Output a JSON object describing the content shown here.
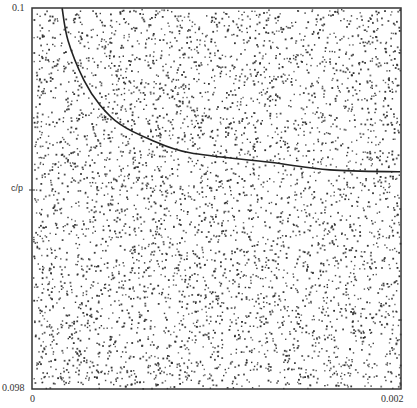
{
  "chart_data": {
    "type": "scatter",
    "title": "",
    "xlabel": "",
    "ylabel": "",
    "xlim": [
      0,
      0.002
    ],
    "ylim": [
      0.098,
      0.1
    ],
    "x_ticks": [
      {
        "value": 0,
        "label": "0"
      },
      {
        "value": 0.002,
        "label": "0.002"
      }
    ],
    "y_ticks": [
      {
        "value": 0.1,
        "label": "0.1"
      },
      {
        "value": 0.09904,
        "label": "c/p"
      },
      {
        "value": 0.098,
        "label": "0.098"
      }
    ],
    "grid": false,
    "legend": null,
    "series": [
      {
        "name": "random points",
        "type": "scatter",
        "distribution": "uniform",
        "approx_count": 4600,
        "color": "#2a2a2a"
      },
      {
        "name": "curve",
        "type": "line",
        "color": "#222222",
        "x": [
          0.000163,
          0.000195,
          0.000282,
          0.000369,
          0.000477,
          0.00064,
          0.000856,
          0.00129,
          0.001615,
          0.001995
        ],
        "y": [
          0.1,
          0.09983,
          0.09962,
          0.09949,
          0.09939,
          0.09931,
          0.09924,
          0.09919,
          0.09915,
          0.09914
        ]
      }
    ]
  },
  "labels": {
    "y_top": "0.1",
    "y_mid": "c/p",
    "y_bottom": "0.098",
    "x_left": "0",
    "x_right": "0.002"
  }
}
